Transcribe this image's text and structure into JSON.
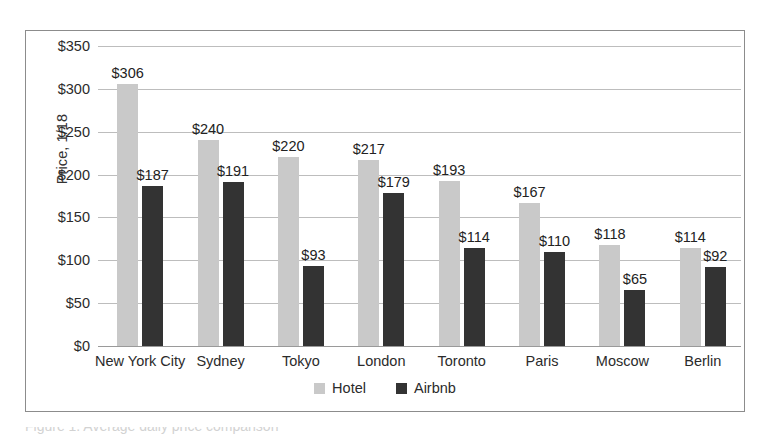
{
  "chart_data": {
    "type": "bar",
    "title": "",
    "xlabel": "",
    "ylabel": "Price, 1/18",
    "ylim": [
      0,
      350
    ],
    "ytick_step": 50,
    "ytick_labels": [
      "$350",
      "$300",
      "$250",
      "$200",
      "$150",
      "$100",
      "$50",
      "$0"
    ],
    "ytick_values": [
      350,
      300,
      250,
      200,
      150,
      100,
      50,
      0
    ],
    "grid": true,
    "legend_position": "bottom-center",
    "value_label_prefix": "$",
    "categories": [
      "New York City",
      "Sydney",
      "Tokyo",
      "London",
      "Toronto",
      "Paris",
      "Moscow",
      "Berlin"
    ],
    "series": [
      {
        "name": "Hotel",
        "color": "#c9c9c9",
        "values": [
          306,
          240,
          220,
          217,
          193,
          167,
          118,
          114
        ],
        "labels": [
          "$306",
          "$240",
          "$220",
          "$217",
          "$193",
          "$167",
          "$118",
          "$114"
        ]
      },
      {
        "name": "Airbnb",
        "color": "#333333",
        "values": [
          187,
          191,
          93,
          179,
          114,
          110,
          65,
          92
        ],
        "labels": [
          "$187",
          "$191",
          "$93",
          "$179",
          "$114",
          "$110",
          "$65",
          "$92"
        ]
      }
    ]
  },
  "legend": {
    "items": [
      {
        "label": "Hotel",
        "color": "#c9c9c9"
      },
      {
        "label": "Airbnb",
        "color": "#333333"
      }
    ]
  },
  "axis": {
    "y_title": "Price, 1/18"
  },
  "caption": {
    "clipped_text": "Figure 1. Average daily price comparison"
  }
}
